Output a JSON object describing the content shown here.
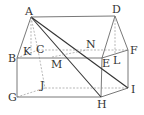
{
  "diagram": {
    "type": "3d-geometry-solid",
    "points": {
      "A": [
        31,
        17
      ],
      "D": [
        115,
        16
      ],
      "B": [
        17,
        58
      ],
      "C": [
        38,
        50
      ],
      "F": [
        128,
        50
      ],
      "E": [
        102,
        58
      ],
      "G": [
        17,
        97
      ],
      "J": [
        45,
        88
      ],
      "H": [
        101,
        97
      ],
      "I": [
        128,
        88
      ],
      "K": [
        30,
        52
      ],
      "M": [
        52,
        57
      ],
      "N": [
        87,
        50
      ],
      "L": [
        115,
        56
      ]
    },
    "labels": [
      {
        "text": "A",
        "x": 25,
        "y": 15
      },
      {
        "text": "D",
        "x": 112,
        "y": 13
      },
      {
        "text": "B",
        "x": 8,
        "y": 62
      },
      {
        "text": "K",
        "x": 23,
        "y": 55
      },
      {
        "text": "C",
        "x": 36,
        "y": 53
      },
      {
        "text": "M",
        "x": 51,
        "y": 68
      },
      {
        "text": "N",
        "x": 86,
        "y": 48
      },
      {
        "text": "E",
        "x": 102,
        "y": 67
      },
      {
        "text": "L",
        "x": 113,
        "y": 64
      },
      {
        "text": "F",
        "x": 130,
        "y": 54
      },
      {
        "text": "J",
        "x": 40,
        "y": 89
      },
      {
        "text": "G",
        "x": 8,
        "y": 101
      },
      {
        "text": "H",
        "x": 97,
        "y": 108
      },
      {
        "text": "I",
        "x": 131,
        "y": 93
      }
    ]
  }
}
